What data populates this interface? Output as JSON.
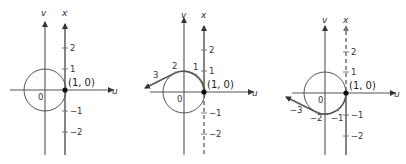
{
  "panels": [
    {
      "id": "panel-1",
      "axis_labels": {
        "vertical_v": "v",
        "vertical_x": "x",
        "horizontal_u": "u"
      },
      "origin_label": "0",
      "point_label": "(1, 0)",
      "x_axis_ticks": [
        "2",
        "1",
        "−1",
        "−2"
      ],
      "wrap_labels": [],
      "x_axis_style": "solid"
    },
    {
      "id": "panel-2",
      "axis_labels": {
        "vertical_v": "v",
        "vertical_x": "x",
        "horizontal_u": "u"
      },
      "origin_label": "0",
      "point_label": "(1, 0)",
      "x_axis_ticks": [
        "2",
        "1",
        "−1",
        "−2"
      ],
      "wrap_labels": [
        "1",
        "2",
        "3"
      ],
      "x_axis_style": "upper solid, lower dashed (wrapped counterclockwise)"
    },
    {
      "id": "panel-3",
      "axis_labels": {
        "vertical_v": "v",
        "vertical_x": "x",
        "horizontal_u": "u"
      },
      "origin_label": "0",
      "point_label": "(1, 0)",
      "x_axis_ticks": [
        "2",
        "1",
        "−1",
        "−2"
      ],
      "wrap_labels": [
        "−1",
        "−2",
        "−3"
      ],
      "x_axis_style": "upper dashed, lower solid (wrapped clockwise)"
    }
  ],
  "colors": {
    "axis": "#555555",
    "text": "#333333",
    "point": "#111111",
    "background": "#ffffff"
  }
}
